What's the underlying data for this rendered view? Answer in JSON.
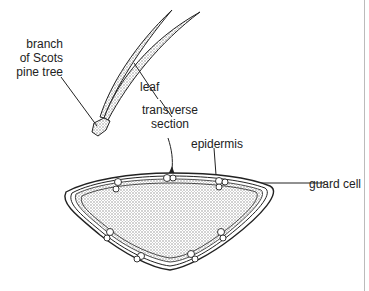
{
  "diagram": {
    "labels": {
      "branch_line1": "branch",
      "branch_line2": "of Scots",
      "branch_line3": "pine tree",
      "leaf": "leaf",
      "section_line1": "transverse",
      "section_line2": "section",
      "epidermis": "epidermis",
      "guard_cell": "guard cell"
    },
    "colors": {
      "stroke": "#222222",
      "stipple": "#bdbdbd",
      "border": "#bbbbbb"
    }
  }
}
